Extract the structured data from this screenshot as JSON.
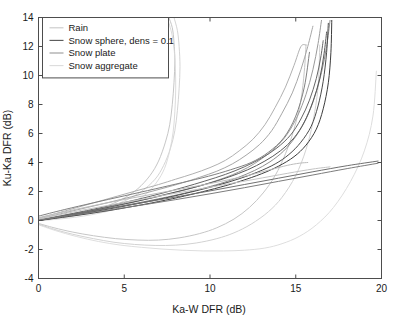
{
  "chart_data": {
    "type": "line",
    "title": "",
    "xlabel": "Ka-W DFR (dB)",
    "ylabel": "Ku-Ka DFR (dB)",
    "xlim": [
      0,
      20
    ],
    "ylim": [
      -4,
      14
    ],
    "xticks": [
      0,
      5,
      10,
      15,
      20
    ],
    "xticklabels": [
      "0",
      "5",
      "10",
      "15",
      "20"
    ],
    "yticks": [
      -4,
      -2,
      0,
      2,
      4,
      6,
      8,
      10,
      12,
      14
    ],
    "yticklabels": [
      "-4",
      "-2",
      "0",
      "2",
      "4",
      "6",
      "8",
      "10",
      "12",
      "14"
    ],
    "grid": false,
    "legend_position": "upper left",
    "legend": [
      {
        "label": "Rain",
        "color": "#c8c8c8"
      },
      {
        "label": "Snow sphere, dens = 0.1",
        "color": "#555555"
      },
      {
        "label": "Snow plate",
        "color": "#9a9a9a"
      },
      {
        "label": "Snow aggregate",
        "color": "#dcdcdc"
      }
    ],
    "series": [
      {
        "name": "Rain 1",
        "group": "Rain",
        "color": "#c0c0c0",
        "width": 0.9,
        "x": [
          0,
          0.6,
          1.4,
          2.3,
          3.2,
          4.1,
          5.0,
          5.8,
          6.5,
          7.0,
          7.4,
          7.65,
          7.8,
          7.9,
          7.95,
          7.9,
          7.8,
          7.6
        ],
        "y": [
          0.0,
          0.08,
          0.22,
          0.42,
          0.7,
          1.05,
          1.55,
          2.2,
          3.1,
          4.1,
          5.4,
          6.6,
          8.0,
          9.5,
          11.0,
          12.3,
          13.3,
          14.0
        ]
      },
      {
        "name": "Rain 2",
        "group": "Rain",
        "color": "#cfcfcf",
        "width": 0.9,
        "x": [
          0,
          0.6,
          1.4,
          2.3,
          3.2,
          4.2,
          5.1,
          6.0,
          6.8,
          7.3,
          7.7,
          7.95,
          8.1,
          8.2,
          8.25,
          8.2,
          8.1,
          7.9
        ],
        "y": [
          0.0,
          0.06,
          0.18,
          0.36,
          0.62,
          0.95,
          1.4,
          2.0,
          2.85,
          3.8,
          5.0,
          6.2,
          7.6,
          9.1,
          10.6,
          12.0,
          13.1,
          14.0
        ]
      },
      {
        "name": "Rain 3",
        "group": "Rain",
        "color": "#d8d8d8",
        "width": 0.9,
        "x": [
          0,
          0.7,
          1.6,
          2.6,
          3.6,
          4.6,
          5.5,
          6.3,
          6.9,
          7.35,
          7.65,
          7.85,
          7.95,
          8.0,
          7.98,
          7.9,
          7.75,
          7.5
        ],
        "y": [
          0.0,
          0.05,
          0.15,
          0.3,
          0.52,
          0.82,
          1.25,
          1.85,
          2.65,
          3.6,
          4.8,
          6.1,
          7.5,
          9.0,
          10.5,
          11.9,
          13.0,
          14.0
        ]
      },
      {
        "name": "Snow aggregate 1",
        "group": "Snow aggregate",
        "color": "#dedede",
        "width": 1.0,
        "x": [
          0,
          1.0,
          2.2,
          3.5,
          4.8,
          6.0,
          7.2,
          8.4,
          9.6,
          10.8,
          12.0,
          13.2,
          14.2,
          15.2,
          16.2,
          17.2,
          18.2,
          19.0,
          19.5,
          19.7
        ],
        "y": [
          -0.3,
          -0.7,
          -1.1,
          -1.45,
          -1.7,
          -1.85,
          -1.97,
          -2.05,
          -2.1,
          -2.1,
          -2.05,
          -1.9,
          -1.6,
          -1.1,
          -0.3,
          0.9,
          2.7,
          4.8,
          7.2,
          10.3
        ]
      },
      {
        "name": "Snow aggregate 2",
        "group": "Snow aggregate",
        "color": "#d2d2d2",
        "width": 1.0,
        "x": [
          0,
          0.9,
          2.0,
          3.2,
          4.4,
          5.6,
          6.8,
          8.0,
          9.2,
          10.4,
          11.4,
          12.4,
          13.4,
          14.2,
          15.0,
          15.6,
          16.0,
          16.3,
          16.4
        ],
        "y": [
          -0.25,
          -0.6,
          -0.95,
          -1.25,
          -1.5,
          -1.65,
          -1.72,
          -1.7,
          -1.55,
          -1.25,
          -0.85,
          -0.25,
          0.6,
          1.6,
          3.1,
          4.9,
          6.8,
          9.2,
          12.1
        ]
      },
      {
        "name": "Snow aggregate 3",
        "group": "Snow aggregate",
        "color": "#c6c6c6",
        "width": 1.0,
        "x": [
          0,
          0.9,
          2.0,
          3.2,
          4.5,
          5.8,
          7.0,
          8.2,
          9.4,
          10.4,
          11.4,
          12.3,
          13.1,
          13.8,
          14.4,
          14.9,
          15.3,
          15.5,
          15.6
        ],
        "y": [
          -0.2,
          -0.5,
          -0.8,
          -1.05,
          -1.25,
          -1.35,
          -1.35,
          -1.2,
          -0.9,
          -0.5,
          0.1,
          0.9,
          1.9,
          3.1,
          4.6,
          6.3,
          8.3,
          10.3,
          12.1
        ]
      },
      {
        "name": "Snow plate 1",
        "group": "Snow plate",
        "color": "#8e8e8e",
        "width": 1.0,
        "x": [
          0,
          1.2,
          2.6,
          4.0,
          5.4,
          6.8,
          8.2,
          9.4,
          10.6,
          11.6,
          12.6,
          13.5,
          14.3,
          15.0,
          15.6,
          16.1,
          16.5,
          16.8,
          17.0
        ],
        "y": [
          0.0,
          0.25,
          0.52,
          0.82,
          1.12,
          1.45,
          1.8,
          2.15,
          2.55,
          2.95,
          3.45,
          4.05,
          4.8,
          5.8,
          7.0,
          8.5,
          10.2,
          12.0,
          13.8
        ]
      },
      {
        "name": "Snow plate 2",
        "group": "Snow plate",
        "color": "#9a9a9a",
        "width": 1.0,
        "x": [
          0,
          1.2,
          2.6,
          4.0,
          5.4,
          6.8,
          8.0,
          9.2,
          10.3,
          11.3,
          12.2,
          13.0,
          13.8,
          14.5,
          15.1,
          15.6,
          16.0,
          16.3,
          16.5
        ],
        "y": [
          0.05,
          0.3,
          0.6,
          0.92,
          1.25,
          1.6,
          1.95,
          2.32,
          2.72,
          3.15,
          3.65,
          4.25,
          5.0,
          5.95,
          7.2,
          8.7,
          10.4,
          12.2,
          13.8
        ]
      },
      {
        "name": "Snow plate 3",
        "group": "Snow plate",
        "color": "#a6a6a6",
        "width": 1.0,
        "x": [
          0,
          1.0,
          2.2,
          3.5,
          4.8,
          6.0,
          7.2,
          8.4,
          9.4,
          10.4,
          11.3,
          12.1,
          12.9,
          13.6,
          14.2,
          14.8,
          15.3,
          15.7,
          16.0
        ],
        "y": [
          0.1,
          0.38,
          0.72,
          1.08,
          1.45,
          1.82,
          2.2,
          2.6,
          2.98,
          3.4,
          3.9,
          4.5,
          5.25,
          6.2,
          7.4,
          8.8,
          10.4,
          12.0,
          13.4
        ]
      },
      {
        "name": "Snow plate 4",
        "group": "Snow plate",
        "color": "#b0b0b0",
        "width": 1.0,
        "x": [
          0,
          1.0,
          2.2,
          3.4,
          4.6,
          5.8,
          7.0,
          8.0,
          9.0,
          10.0,
          10.9,
          11.7,
          12.5,
          13.2,
          13.8,
          14.4,
          14.9,
          15.3,
          15.6
        ],
        "y": [
          0.15,
          0.48,
          0.88,
          1.28,
          1.68,
          2.08,
          2.48,
          2.85,
          3.22,
          3.65,
          4.15,
          4.8,
          5.6,
          6.6,
          7.8,
          9.2,
          10.7,
          12.0,
          12.1
        ]
      },
      {
        "name": "Snow sphere 1",
        "group": "Snow sphere",
        "color": "#3c3c3c",
        "width": 1.0,
        "x": [
          0,
          1.4,
          3.0,
          4.6,
          6.2,
          7.8,
          9.2,
          10.6,
          11.8,
          13.0,
          14.0,
          14.9,
          15.6,
          16.2,
          16.6,
          16.9,
          17.05,
          17.1
        ],
        "y": [
          0.0,
          0.22,
          0.48,
          0.78,
          1.12,
          1.5,
          1.88,
          2.3,
          2.72,
          3.22,
          3.75,
          4.4,
          5.2,
          6.3,
          7.7,
          9.5,
          11.6,
          13.8
        ]
      },
      {
        "name": "Snow sphere 2",
        "group": "Snow sphere",
        "color": "#4a4a4a",
        "width": 1.0,
        "x": [
          0,
          1.4,
          3.0,
          4.6,
          6.2,
          7.8,
          9.2,
          10.5,
          11.7,
          12.8,
          13.8,
          14.6,
          15.3,
          15.9,
          16.3,
          16.6,
          16.8,
          16.9
        ],
        "y": [
          0.0,
          0.26,
          0.56,
          0.9,
          1.26,
          1.66,
          2.05,
          2.45,
          2.88,
          3.35,
          3.9,
          4.55,
          5.4,
          6.5,
          7.9,
          9.6,
          11.6,
          13.6
        ]
      },
      {
        "name": "Snow sphere 3",
        "group": "Snow sphere",
        "color": "#585858",
        "width": 1.0,
        "x": [
          0,
          1.3,
          2.8,
          4.3,
          5.8,
          7.2,
          8.6,
          9.9,
          11.1,
          12.2,
          13.2,
          14.1,
          14.9,
          15.5,
          16.0,
          16.4,
          16.65,
          16.8
        ],
        "y": [
          0.0,
          0.28,
          0.6,
          0.96,
          1.34,
          1.74,
          2.14,
          2.55,
          3.0,
          3.5,
          4.1,
          4.8,
          5.7,
          6.8,
          8.2,
          9.8,
          11.5,
          13.0
        ]
      },
      {
        "name": "Snow sphere 4",
        "group": "Snow sphere",
        "color": "#666666",
        "width": 1.0,
        "x": [
          0,
          1.3,
          2.8,
          4.3,
          5.8,
          7.2,
          8.5,
          9.7,
          10.9,
          12.0,
          13.0,
          13.9,
          14.7,
          15.3,
          15.8,
          16.2,
          16.45,
          16.6
        ],
        "y": [
          0.0,
          0.32,
          0.68,
          1.06,
          1.46,
          1.88,
          2.3,
          2.72,
          3.18,
          3.7,
          4.3,
          5.0,
          5.9,
          7.0,
          8.3,
          9.8,
          11.2,
          12.4
        ]
      },
      {
        "name": "Snow sphere 5 shallow",
        "group": "Snow sphere",
        "color": "#707070",
        "width": 1.0,
        "x": [
          0,
          2.0,
          4.0,
          6.0,
          8.0,
          10.0,
          12.0,
          14.0,
          16.0,
          18.0,
          19.8
        ],
        "y": [
          0.0,
          0.42,
          0.82,
          1.22,
          1.62,
          2.04,
          2.48,
          2.92,
          3.36,
          3.78,
          4.1
        ]
      },
      {
        "name": "Snow sphere 6 shallow",
        "group": "Snow sphere",
        "color": "#7c7c7c",
        "width": 1.0,
        "x": [
          0,
          2.0,
          4.0,
          6.0,
          8.0,
          10.0,
          12.0,
          14.0,
          16.0,
          18.0,
          19.8
        ],
        "y": [
          0.05,
          0.36,
          0.7,
          1.06,
          1.44,
          1.84,
          2.26,
          2.7,
          3.14,
          3.58,
          3.95
        ]
      },
      {
        "name": "Upper arc plate",
        "group": "Snow plate",
        "color": "#808080",
        "width": 1.0,
        "x": [
          0,
          1.5,
          3.2,
          5.0,
          6.8,
          8.4,
          9.9,
          11.2,
          12.4,
          13.4,
          14.3,
          15.0,
          15.5,
          15.8
        ],
        "y": [
          0.3,
          0.75,
          1.22,
          1.7,
          2.18,
          2.62,
          3.05,
          3.5,
          4.0,
          4.7,
          5.7,
          7.2,
          9.2,
          11.6
        ]
      },
      {
        "name": "Low flat 1",
        "group": "Snow aggregate",
        "color": "#bcbcbc",
        "width": 1.0,
        "x": [
          0,
          2.5,
          5.0,
          7.5,
          10.0,
          12.0,
          13.5,
          14.5,
          15.2,
          15.7
        ],
        "y": [
          0.2,
          0.85,
          1.45,
          2.0,
          2.55,
          3.05,
          3.5,
          3.8,
          3.95,
          4.0
        ]
      },
      {
        "name": "Low flat 2",
        "group": "Snow aggregate",
        "color": "#c4c4c4",
        "width": 1.0,
        "x": [
          0,
          2.5,
          5.0,
          7.5,
          10.0,
          12.5,
          14.5,
          16.0,
          17.0
        ],
        "y": [
          0.1,
          0.7,
          1.25,
          1.78,
          2.3,
          2.82,
          3.25,
          3.55,
          3.7
        ]
      }
    ]
  }
}
